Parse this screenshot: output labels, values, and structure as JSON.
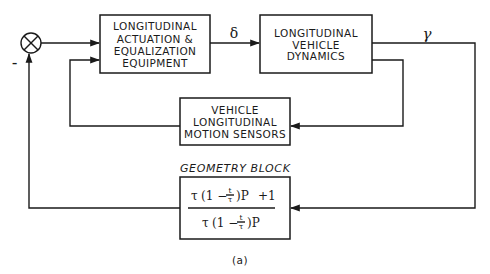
{
  "diagram": {
    "type": "feedback control block diagram",
    "caption": "(a)",
    "summing_junction": {
      "symbol": "⊗",
      "feedback_sign": "–"
    },
    "blocks": {
      "actuation": {
        "lines": [
          "LONGITUDINAL",
          "ACTUATION &",
          "EQUALIZATION",
          "EQUIPMENT"
        ]
      },
      "dynamics": {
        "lines": [
          "LONGITUDINAL",
          "VEHICLE",
          "DYNAMICS"
        ]
      },
      "sensors": {
        "lines": [
          "VEHICLE",
          "LONGITUDINAL",
          "MOTION SENSORS"
        ]
      },
      "geometry": {
        "title": "GEOMETRY BLOCK",
        "numerator": {
          "tau": "τ",
          "open": "(1 −",
          "frac_num": "t",
          "frac_den": "τ",
          "close": ")P",
          "plus": "+1"
        },
        "denominator": {
          "tau": "τ",
          "open": "(1 −",
          "frac_num": "t",
          "frac_den": "τ",
          "close": ")P"
        }
      }
    },
    "signals": {
      "actuation_output": "δ",
      "dynamics_output": "γ"
    },
    "connections": [
      "summing junction → actuation block",
      "actuation block → dynamics block (δ)",
      "dynamics block → γ output → geometry block → summing junction (negative feedback)",
      "dynamics block → sensors block → actuation block (inner loop)"
    ]
  }
}
